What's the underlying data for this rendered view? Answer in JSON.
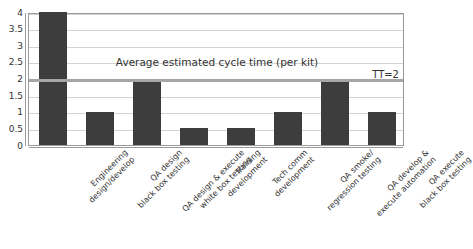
{
  "chart_data": {
    "type": "bar",
    "title": "",
    "xlabel": "",
    "ylabel": "",
    "ylim": [
      0,
      4
    ],
    "ytick_step": 0.5,
    "grid": true,
    "legend": "none",
    "categories": [
      "Engineering design/develop",
      "QA design black box testing",
      "QA design & execute white box testing",
      "Training development",
      "Tech comm development",
      "QA smoke/ regression testing",
      "QA develop & execute automation",
      "QA execute black box testing"
    ],
    "category_lines": [
      [
        "Engineering",
        "design/develop"
      ],
      [
        "QA design",
        "black box testing"
      ],
      [
        "QA design & execute",
        "white box testing"
      ],
      [
        "Training",
        "development"
      ],
      [
        "Tech comm",
        "development"
      ],
      [
        "QA smoke/",
        "regression testing"
      ],
      [
        "QA develop &",
        "execute automation"
      ],
      [
        "QA execute",
        "black box testing"
      ]
    ],
    "values": [
      4,
      1,
      2,
      0.5,
      0.5,
      1,
      2,
      1
    ],
    "ytick_labels": [
      "4",
      "3.5",
      "3",
      "2.5",
      "2",
      "1.5",
      "1",
      "0.5",
      "0"
    ],
    "ytick_values": [
      4,
      3.5,
      3,
      2.5,
      2,
      1.5,
      1,
      0.5,
      0
    ],
    "annotations": [
      {
        "name": "average-cycle-time-note",
        "text": "Average estimated cycle time (per kit)",
        "y": 2.55
      },
      {
        "name": "takt-time-label",
        "text": "TT=2",
        "y": 2.18
      }
    ],
    "reference_line": {
      "name": "takt-time-line",
      "value": 2,
      "label": "TT=2",
      "color": "#a6a6a6"
    },
    "colors": {
      "bar_fill": "#3d3d3d",
      "gridline": "#d2d2d2",
      "axis": "#9a9a9a",
      "reference_line": "#a6a6a6",
      "text": "#333333",
      "background": "#ffffff"
    }
  }
}
